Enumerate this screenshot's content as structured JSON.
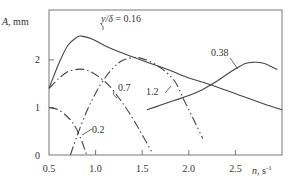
{
  "chart_data": {
    "type": "line",
    "title": "",
    "xlabel": "n, s⁻¹",
    "ylabel": "A, mm",
    "xlim": [
      0.5,
      3.0
    ],
    "ylim": [
      0,
      3.05
    ],
    "xticks": [
      0.5,
      1.0,
      1.5,
      2.0,
      2.5
    ],
    "xtick_labels": [
      "0.5",
      "1.0",
      "1.5",
      "2.0",
      "2.5"
    ],
    "yticks": [
      0,
      1,
      2
    ],
    "ytick_labels": [
      "0",
      "1",
      "2"
    ],
    "grid": false,
    "legend": "inline curve labels",
    "series": [
      {
        "name": "y/δ = 0.16",
        "label": "y/δ = 0.16",
        "style": "solid",
        "x": [
          0.5,
          0.6,
          0.7,
          0.8,
          0.85,
          0.95,
          1.1,
          1.25,
          1.4,
          1.6,
          1.8,
          2.0,
          2.2,
          2.4,
          2.6,
          2.8,
          3.0
        ],
        "y": [
          1.4,
          1.9,
          2.3,
          2.48,
          2.5,
          2.45,
          2.3,
          2.17,
          2.06,
          1.92,
          1.78,
          1.62,
          1.5,
          1.36,
          1.22,
          1.08,
          0.95
        ]
      },
      {
        "name": "0.7",
        "label": "0.7",
        "style": "dash-dot",
        "x": [
          0.5,
          0.6,
          0.7,
          0.8,
          0.87,
          0.95,
          1.05,
          1.15,
          1.25,
          1.35,
          1.45,
          1.55,
          1.6
        ],
        "y": [
          1.4,
          1.6,
          1.75,
          1.8,
          1.8,
          1.75,
          1.62,
          1.45,
          1.2,
          0.92,
          0.6,
          0.25,
          0.08
        ]
      },
      {
        "name": "1.2",
        "label": "1.2",
        "style": "dash-dot-dot",
        "x": [
          0.73,
          0.8,
          0.9,
          1.0,
          1.1,
          1.2,
          1.3,
          1.45,
          1.6,
          1.72,
          1.85,
          1.95,
          2.05,
          2.15
        ],
        "y": [
          0.0,
          0.4,
          0.9,
          1.3,
          1.62,
          1.85,
          2.0,
          2.05,
          1.95,
          1.8,
          1.55,
          1.15,
          0.75,
          0.35
        ]
      },
      {
        "name": "0.2",
        "label": "0.2",
        "style": "dash-dot",
        "x": [
          0.5,
          0.6,
          0.7,
          0.78,
          0.85,
          0.9
        ],
        "y": [
          1.0,
          0.95,
          0.8,
          0.6,
          0.3,
          0.02
        ]
      },
      {
        "name": "0.38",
        "label": "0.38",
        "style": "solid",
        "x": [
          1.55,
          1.7,
          1.85,
          2.0,
          2.15,
          2.3,
          2.45,
          2.6,
          2.7,
          2.8,
          2.95
        ],
        "y": [
          0.95,
          1.05,
          1.15,
          1.25,
          1.38,
          1.55,
          1.75,
          1.92,
          1.95,
          1.93,
          1.8
        ]
      }
    ],
    "annotations": [
      {
        "text": "y/δ = 0.16",
        "x": 1.2,
        "y": 2.6
      },
      {
        "text": "0.7",
        "x": 1.3,
        "y": 1.65
      },
      {
        "text": "1.2",
        "x": 1.6,
        "y": 1.3
      },
      {
        "text": "0.2",
        "x": 0.95,
        "y": 0.5
      },
      {
        "text": "0.38",
        "x": 2.45,
        "y": 2.2
      }
    ]
  },
  "labels": {
    "y_axis_A": "A",
    "y_axis_unit": ", mm",
    "x_axis_n": "n",
    "x_axis_unit": ", s",
    "x_axis_exp": "-1",
    "curve_016_prefix": "y/δ",
    "curve_016_value": " = 0.16",
    "curve_07": "0.7",
    "curve_12": "1.2",
    "curve_02": "0.2",
    "curve_038": "0.38"
  },
  "colors": {
    "axis": "#666666",
    "curve": "#444444",
    "text": "#333333"
  }
}
